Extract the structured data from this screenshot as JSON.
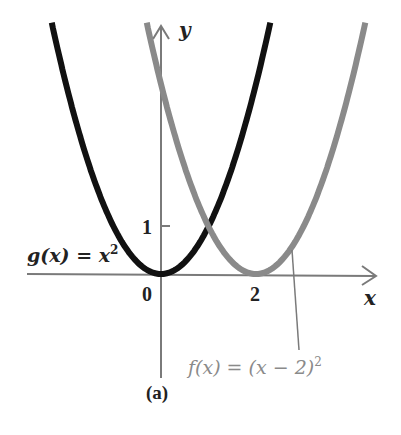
{
  "chart_data": {
    "type": "line",
    "title": "",
    "caption": "(a)",
    "xlabel": "x",
    "ylabel": "y",
    "x_ticks": [
      {
        "value": 0,
        "label": "0"
      },
      {
        "value": 2,
        "label": "2"
      }
    ],
    "y_ticks": [
      {
        "value": 1,
        "label": "1"
      }
    ],
    "xlim": [
      -2.8,
      4.6
    ],
    "ylim": [
      -2.2,
      5.3
    ],
    "grid": false,
    "legend": "inline annotations",
    "series": [
      {
        "name": "g(x) = x²",
        "label": "g(x) = x²",
        "formula": "x^2",
        "color": "#111111",
        "x": [
          -2.2,
          -2,
          -1.5,
          -1,
          -0.5,
          0,
          0.5,
          1,
          1.5,
          2,
          2.3
        ],
        "values": [
          4.84,
          4,
          2.25,
          1,
          0.25,
          0,
          0.25,
          1,
          2.25,
          4,
          5.29
        ]
      },
      {
        "name": "f(x) = (x − 2)²",
        "label": "f(x) = (x − 2)²",
        "formula": "(x-2)^2",
        "color": "#8a8a8a",
        "x": [
          -0.3,
          0,
          0.5,
          1,
          1.5,
          2,
          2.5,
          3,
          3.5,
          4,
          4.2
        ],
        "values": [
          5.29,
          4,
          2.25,
          1,
          0.25,
          0,
          0.25,
          1,
          2.25,
          4,
          4.84
        ]
      }
    ],
    "annotations": [
      {
        "text": "g(x) = x²",
        "target": "g",
        "position": "left of vertex"
      },
      {
        "text": "f(x) = (x − 2)²",
        "target": "f",
        "position": "below, with leader line to curve near x≈2.8"
      }
    ]
  },
  "labels": {
    "y_axis": "y",
    "x_axis": "x",
    "origin": "0",
    "tick_x_2": "2",
    "tick_y_1": "1",
    "g_label_prefix": "g(x) = x",
    "g_label_exp": "2",
    "f_label_prefix": "f(x) = (x − 2)",
    "f_label_exp": "2",
    "caption": "(a)"
  },
  "colors": {
    "axis": "#7a7a7a",
    "g_curve": "#111111",
    "f_curve": "#8a8a8a",
    "f_label": "#8a8a8a",
    "text": "#222222"
  }
}
